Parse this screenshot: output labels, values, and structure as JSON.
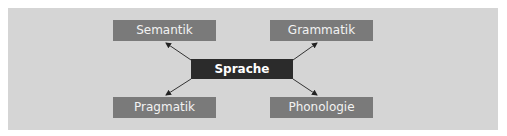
{
  "diagram": {
    "center": {
      "label": "Sprache"
    },
    "nodes": [
      {
        "label": "Semantik",
        "position": "top-left"
      },
      {
        "label": "Grammatik",
        "position": "top-right"
      },
      {
        "label": "Pragmatik",
        "position": "bottom-left"
      },
      {
        "label": "Phonologie",
        "position": "bottom-right"
      }
    ],
    "colors": {
      "panel": "#d5d5d5",
      "leaf": "#7a7a7a",
      "center": "#2b2b2b",
      "arrow": "#333333"
    }
  }
}
